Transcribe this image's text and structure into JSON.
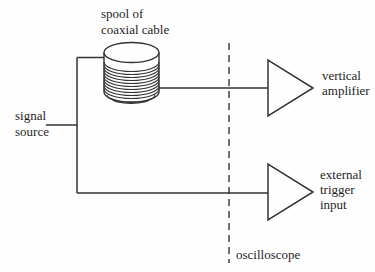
{
  "diagram": {
    "type": "block-diagram",
    "colors": {
      "background": "#fefefe",
      "line": "#333333",
      "text": "#1f1f1f"
    },
    "labels": {
      "spool": {
        "line1": "spool of",
        "line2": "coaxial cable"
      },
      "signal_source": {
        "line1": "signal",
        "line2": "source"
      },
      "vertical_amplifier": {
        "line1": "vertical",
        "line2": "amplifier"
      },
      "external_trigger": {
        "line1": "external",
        "line2": "trigger",
        "line3": "input"
      },
      "oscilloscope": "oscilloscope"
    },
    "nodes": [
      {
        "id": "signal-source",
        "label": "signal source"
      },
      {
        "id": "spool-of-coaxial-cable",
        "label": "spool of coaxial cable",
        "symbol": "coil-cylinder"
      },
      {
        "id": "vertical-amplifier",
        "label": "vertical amplifier",
        "symbol": "triangle-amplifier"
      },
      {
        "id": "external-trigger-input",
        "label": "external trigger input",
        "symbol": "triangle-amplifier"
      },
      {
        "id": "oscilloscope",
        "label": "oscilloscope",
        "symbol": "dashed-boundary"
      }
    ],
    "connections": [
      {
        "from": "signal-source",
        "to": "spool-of-coaxial-cable"
      },
      {
        "from": "spool-of-coaxial-cable",
        "to": "vertical-amplifier"
      },
      {
        "from": "signal-source",
        "to": "external-trigger-input"
      }
    ]
  }
}
